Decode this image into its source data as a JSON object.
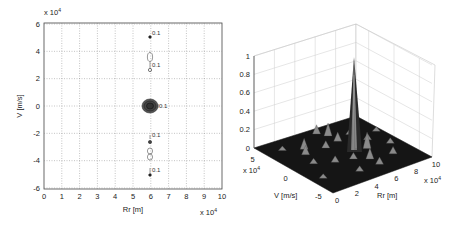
{
  "chart_data": [
    {
      "type": "contour",
      "title": "",
      "xlabel": "Rr [m]",
      "ylabel": "V [m/s]",
      "x_multiplier": "x 10^4",
      "y_multiplier": "x 10^4",
      "xlim": [
        0,
        10
      ],
      "ylim": [
        -6,
        6
      ],
      "x_ticks": [
        "0",
        "1",
        "2",
        "3",
        "4",
        "5",
        "6",
        "7",
        "8",
        "9",
        "10"
      ],
      "y_ticks": [
        "6",
        "4",
        "2",
        "0",
        "-2",
        "-4",
        "-6"
      ],
      "grid": true,
      "contour_level_label": "0.1",
      "features": [
        {
          "x": 6.0,
          "y": 5.0,
          "kind": "dot",
          "label": "0.1"
        },
        {
          "x": 6.0,
          "y": 3.5,
          "kind": "small-loop"
        },
        {
          "x": 6.0,
          "y": 2.5,
          "kind": "dot",
          "label": "0.1"
        },
        {
          "x": 6.0,
          "y": 0.0,
          "kind": "main-lobe",
          "label": "0.1"
        },
        {
          "x": 6.0,
          "y": -2.5,
          "kind": "dot",
          "label": "0.1"
        },
        {
          "x": 6.0,
          "y": -3.5,
          "kind": "small-loop"
        },
        {
          "x": 6.0,
          "y": -5.0,
          "kind": "dot",
          "label": "0.1"
        }
      ]
    },
    {
      "type": "surface3d",
      "title": "",
      "xlabel": "Rr [m]",
      "ylabel": "V [m/s]",
      "zlabel": "",
      "x_multiplier": "x 10^4",
      "y_multiplier": "x 10^4",
      "xlim": [
        0,
        10
      ],
      "ylim": [
        -6,
        6
      ],
      "zlim": [
        0,
        1
      ],
      "x_ticks": [
        "0",
        "2",
        "4",
        "6",
        "8",
        "10"
      ],
      "y_ticks": [
        "5",
        "0",
        "-5"
      ],
      "z_ticks": [
        "0",
        "0.2",
        "0.4",
        "0.6",
        "0.8",
        "1"
      ],
      "grid": true,
      "peak": {
        "x": 6.0,
        "y": 0.0,
        "z": 1.0
      },
      "sidelobe_level_approx": 0.1
    }
  ],
  "left": {
    "multiplier_top": "x 10",
    "multiplier_top_exp": "4",
    "multiplier_bottom": "x 10",
    "multiplier_bottom_exp": "4",
    "xlabel": "Rr [m]",
    "ylabel": "V [m/s]",
    "contour_label": "0.1"
  },
  "right": {
    "xlabel": "Rr [m]",
    "ylabel": "V [m/s]",
    "x_mult": "x 10",
    "x_mult_exp": "4",
    "y_mult": "x 10",
    "y_mult_exp": "4"
  }
}
